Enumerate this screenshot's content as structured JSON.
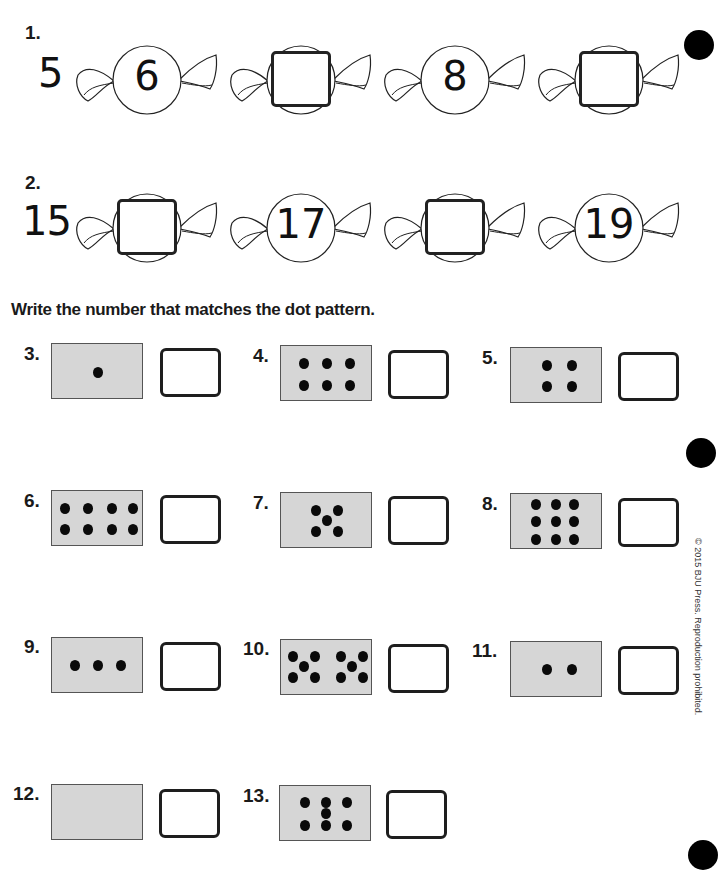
{
  "problem1": {
    "number": "1.",
    "start": "5",
    "candies": [
      {
        "value": "6",
        "blank": false
      },
      {
        "value": "",
        "blank": true
      },
      {
        "value": "8",
        "blank": false
      },
      {
        "value": "",
        "blank": true
      }
    ]
  },
  "problem2": {
    "number": "2.",
    "start": "15",
    "candies": [
      {
        "value": "",
        "blank": true
      },
      {
        "value": "17",
        "blank": false
      },
      {
        "value": "",
        "blank": true
      },
      {
        "value": "19",
        "blank": false
      }
    ]
  },
  "instruction": "Write the number that matches the dot pattern.",
  "dot_problems": [
    {
      "number": "3.",
      "dots": 1
    },
    {
      "number": "4.",
      "dots": 6
    },
    {
      "number": "5.",
      "dots": 4
    },
    {
      "number": "6.",
      "dots": 8
    },
    {
      "number": "7.",
      "dots": 5
    },
    {
      "number": "8.",
      "dots": 9
    },
    {
      "number": "9.",
      "dots": 3
    },
    {
      "number": "10.",
      "dots": 10
    },
    {
      "number": "11.",
      "dots": 2
    },
    {
      "number": "12.",
      "dots": 0
    },
    {
      "number": "13.",
      "dots": 7
    }
  ],
  "copyright": "© 2015 BJU Press. Reproduction prohibited."
}
